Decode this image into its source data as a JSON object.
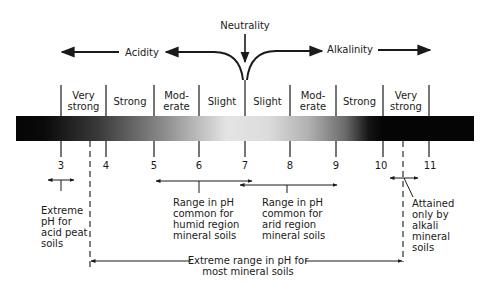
{
  "header": {
    "neutrality": "Neutrality",
    "acidity": "Acidity",
    "alkalinity": "Alkalinity"
  },
  "categories": [
    {
      "label": "Very\nstrong",
      "from": 3,
      "to": 4
    },
    {
      "label": "Strong",
      "from": 4,
      "to": 5
    },
    {
      "label": "Mod-\nerate",
      "from": 5,
      "to": 6
    },
    {
      "label": "Slight",
      "from": 6,
      "to": 7
    },
    {
      "label": "Slight",
      "from": 7,
      "to": 8
    },
    {
      "label": "Mod-\nerate",
      "from": 8,
      "to": 9
    },
    {
      "label": "Strong",
      "from": 9,
      "to": 10
    },
    {
      "label": "Very\nstrong",
      "from": 10,
      "to": 11
    }
  ],
  "ticks": [
    "3",
    "4",
    "5",
    "6",
    "7",
    "8",
    "9",
    "10",
    "11"
  ],
  "annotations": {
    "acid_peat": "Extreme\npH for\nacid peat\nsoils",
    "humid": "Range in pH\ncommon for\nhumid region\nmineral soils",
    "arid": "Range in pH\ncommon for\narid region\nmineral soils",
    "alkali": "Attained\nonly by\nalkali\nmineral\nsoils",
    "extreme_range": "Extreme range in pH for\nmost mineral soils"
  },
  "colors": {
    "ink": "#1a1a1a",
    "bar_dark": "#050505",
    "bar_light": "#e6e6e6"
  }
}
